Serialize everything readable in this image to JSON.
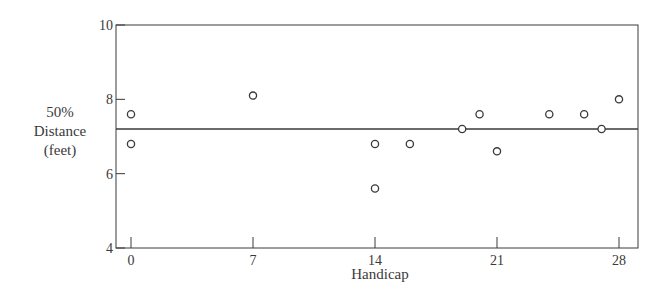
{
  "chart_data": {
    "type": "scatter",
    "title": "",
    "xlabel": "Handicap",
    "ylabel": [
      "50%",
      "Distance",
      "(feet)"
    ],
    "xlim": [
      -0.9,
      29.1
    ],
    "ylim": [
      4,
      10
    ],
    "xticks": [
      0,
      7,
      14,
      21,
      28
    ],
    "yticks": [
      4,
      6,
      8,
      10
    ],
    "grid": false,
    "legend": null,
    "reference_line": {
      "y": 7.2,
      "style": "solid horizontal"
    },
    "series": [
      {
        "name": "players",
        "marker": "open-circle",
        "points": [
          {
            "x": 0,
            "y": 7.6
          },
          {
            "x": 0,
            "y": 6.8
          },
          {
            "x": 7,
            "y": 8.1
          },
          {
            "x": 14,
            "y": 6.8
          },
          {
            "x": 14,
            "y": 5.6
          },
          {
            "x": 16,
            "y": 6.8
          },
          {
            "x": 19,
            "y": 7.2
          },
          {
            "x": 20,
            "y": 7.6
          },
          {
            "x": 21,
            "y": 6.6
          },
          {
            "x": 24,
            "y": 7.6
          },
          {
            "x": 26,
            "y": 7.6
          },
          {
            "x": 27,
            "y": 7.2
          },
          {
            "x": 28,
            "y": 8.0
          }
        ]
      }
    ]
  },
  "colors": {
    "ink": "#3a3a3a",
    "background": "#ffffff"
  }
}
